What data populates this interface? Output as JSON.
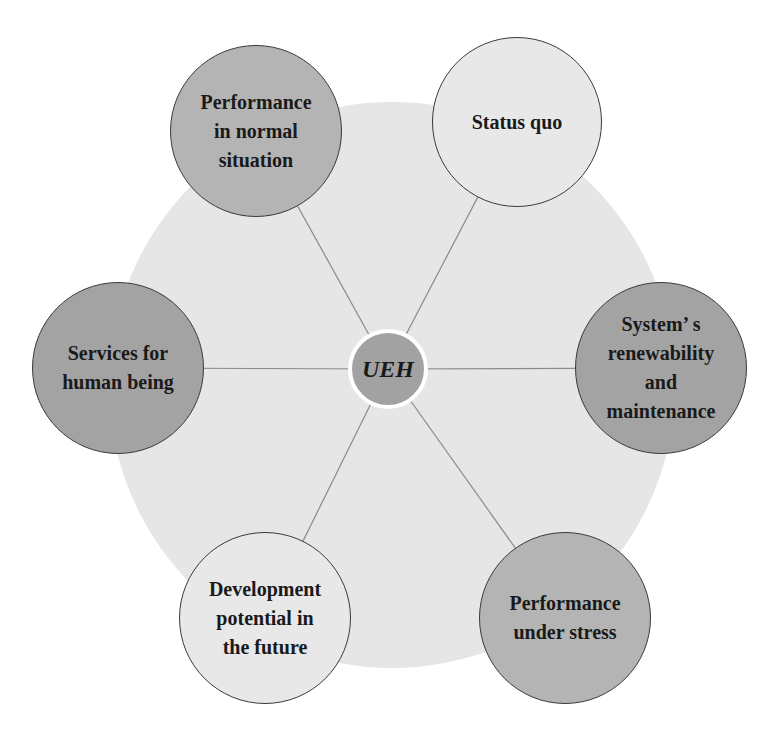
{
  "diagram": {
    "type": "hub-and-spoke",
    "background_disc": {
      "cx": 392,
      "cy": 385,
      "r": 283,
      "color": "#e6e6e6"
    },
    "hub": {
      "label": "UEH",
      "cx": 388,
      "cy": 369,
      "r": 40,
      "color": "#a2a2a2"
    },
    "spoke_color": "#8a8a8a",
    "nodes": [
      {
        "id": "performance-normal",
        "label": "Performance\nin normal\nsituation",
        "cx": 256,
        "cy": 131,
        "r": 86,
        "color": "#b4b4b4"
      },
      {
        "id": "status-quo",
        "label": "Status quo",
        "cx": 517,
        "cy": 122,
        "r": 85,
        "color": "#e8e8e8"
      },
      {
        "id": "services-human",
        "label": "Services  for\nhuman being",
        "cx": 118,
        "cy": 368,
        "r": 86,
        "color": "#a3a3a3"
      },
      {
        "id": "system-renewability",
        "label": "System’ s\nrenewability\nand\nmaintenance",
        "cx": 661,
        "cy": 368,
        "r": 86,
        "color": "#a3a3a3"
      },
      {
        "id": "development-potential",
        "label": "Development\npotential in\nthe future",
        "cx": 265,
        "cy": 618,
        "r": 86,
        "color": "#e8e8e8"
      },
      {
        "id": "performance-stress",
        "label": "Performance\nunder stress",
        "cx": 565,
        "cy": 618,
        "r": 86,
        "color": "#b4b4b4"
      }
    ]
  }
}
